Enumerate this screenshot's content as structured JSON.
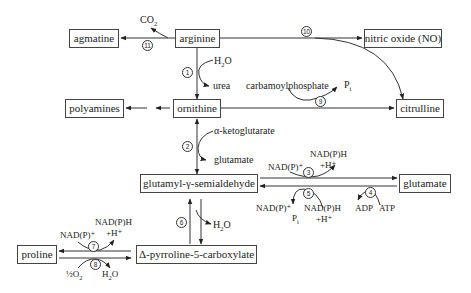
{
  "nodes": {
    "agmatine": "agmatine",
    "arginine": "arginine",
    "nitric_oxide": "nitric oxide (NO)",
    "polyamines": "polyamines",
    "ornithine": "ornithine",
    "citrulline": "citrulline",
    "glutamyl_semialdehyde": "glutamyl-γ-semialdehyde",
    "glutamate": "glutamate",
    "proline": "proline",
    "p5c": "Δ-pyrroline-5-carboxylate"
  },
  "labels": {
    "co2": "CO",
    "co2_sub": "2",
    "h2o_1": "H",
    "h2o_1_sub": "2",
    "h2o_1_tail": "O",
    "urea": "urea",
    "carbamoylphosphate": "carbamoylphosphate",
    "pi_9": "P",
    "pi_9_sub": "i",
    "akg": "α-ketoglutarate",
    "glutamate_2": "glutamate",
    "nadp_plus_3": "NAD(P)⁺",
    "nadph_3": "NAD(P)H",
    "h_plus_3": "+H⁺",
    "nadp_plus_5": "NAD(P)⁺",
    "pi_5": "P",
    "pi_5_sub": "i",
    "nadph_5": "NAD(P)H",
    "h_plus_5": "+H⁺",
    "adp": "ADP",
    "atp": "ATP",
    "h2o_6": "H",
    "h2o_6_sub": "2",
    "h2o_6_tail": "O",
    "nadp_plus_7": "NAD(P)⁺",
    "nadph_7": "NAD(P)H",
    "h_plus_7": "+H⁺",
    "half_o2": "½O",
    "half_o2_sub": "2",
    "h2o_8": "H",
    "h2o_8_sub": "2",
    "h2o_8_tail": "O"
  },
  "enzymes": [
    "1",
    "2",
    "3",
    "4",
    "5",
    "6",
    "7",
    "8",
    "9",
    "10",
    "11"
  ],
  "colors": {
    "line": "#333333",
    "box_border": "#444444",
    "text": "#222222"
  }
}
